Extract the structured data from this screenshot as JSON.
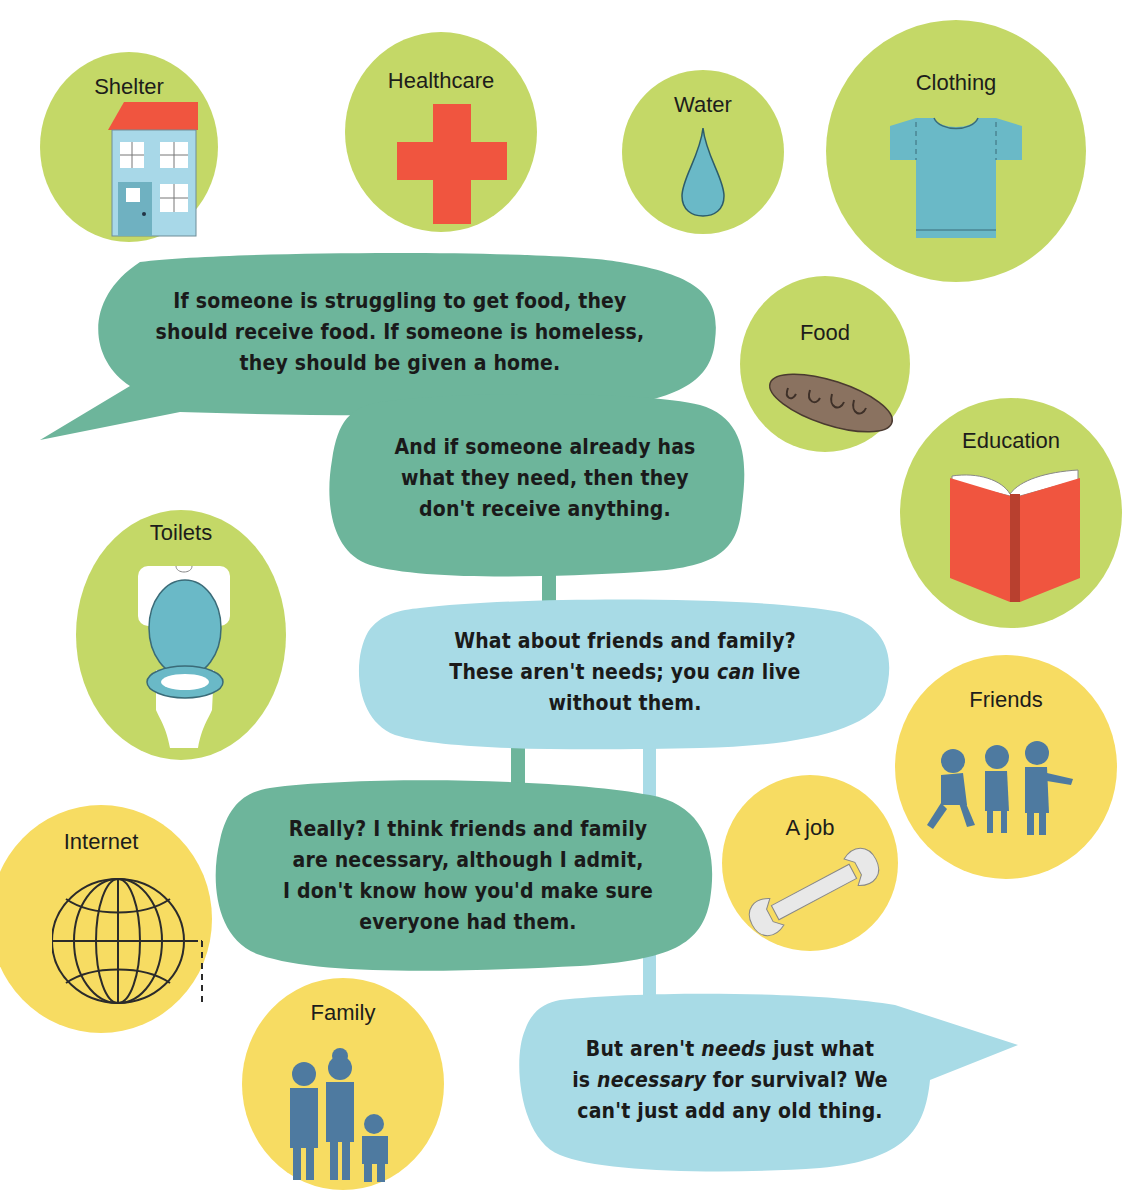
{
  "colors": {
    "circle_green": "#c4d867",
    "circle_yellow": "#f7dc62",
    "bubble_teal": "#6db59b",
    "bubble_light_blue": "#a8dbe6",
    "accent_red": "#f0553f",
    "icon_blue": "#6ab9c7"
  },
  "circles": {
    "shelter": {
      "label": "Shelter",
      "icon": "house-icon"
    },
    "healthcare": {
      "label": "Healthcare",
      "icon": "red-cross-icon"
    },
    "water": {
      "label": "Water",
      "icon": "water-drop-icon"
    },
    "clothing": {
      "label": "Clothing",
      "icon": "t-shirt-icon"
    },
    "food": {
      "label": "Food",
      "icon": "bread-icon"
    },
    "education": {
      "label": "Education",
      "icon": "book-icon"
    },
    "toilets": {
      "label": "Toilets",
      "icon": "toilet-icon"
    },
    "friends": {
      "label": "Friends",
      "icon": "children-icon"
    },
    "job": {
      "label": "A job",
      "icon": "wrench-icon"
    },
    "internet": {
      "label": "Internet",
      "icon": "globe-icon"
    },
    "family": {
      "label": "Family",
      "icon": "family-icon"
    }
  },
  "bubbles": {
    "b1": {
      "lines": [
        "If someone is struggling to get food, they",
        "should receive food. If someone is homeless,",
        "they should be given a home."
      ]
    },
    "b2": {
      "lines": [
        "And if someone already has",
        "what they need, then they",
        "don't receive anything."
      ]
    },
    "b3": {
      "line1": "What about friends and family?",
      "line2_pre": "These aren't needs; you ",
      "line2_em": "can",
      "line2_post": " live",
      "line3": "without them."
    },
    "b4": {
      "lines": [
        "Really? I think friends and family",
        "are necessary, although I admit,",
        "I don't know how you'd make sure",
        "everyone had them."
      ]
    },
    "b5": {
      "line1_pre": "But aren't ",
      "line1_em": "needs",
      "line1_post": " just what",
      "line2_pre": "is ",
      "line2_em": "necessary",
      "line2_post": " for survival? We",
      "line3": "can't just add any old thing."
    }
  }
}
